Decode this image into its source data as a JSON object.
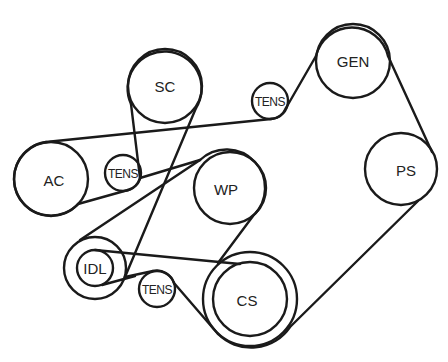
{
  "diagram": {
    "type": "serpentine-belt-routing",
    "colors": {
      "stroke": "#1a1a1a",
      "text": "#222222",
      "background": "#ffffff"
    },
    "pulleys": {
      "sc": {
        "label": "SC",
        "cx": 165,
        "cy": 86,
        "r": 37
      },
      "gen": {
        "label": "GEN",
        "cx": 353,
        "cy": 61,
        "r": 37
      },
      "tens_top": {
        "label": "TENS",
        "cx": 270,
        "cy": 101,
        "r": 18
      },
      "ac": {
        "label": "AC",
        "cx": 51,
        "cy": 179,
        "r": 37
      },
      "tens_mid": {
        "label": "TENS",
        "cx": 123,
        "cy": 173,
        "r": 18
      },
      "wp": {
        "label": "WP",
        "cx": 230,
        "cy": 188,
        "r": 36
      },
      "ps": {
        "label": "PS",
        "cx": 401,
        "cy": 169,
        "r": 36
      },
      "idl": {
        "label": "IDL",
        "cx": 95,
        "cy": 268,
        "r_outer": 31,
        "r_inner": 18
      },
      "tens_low": {
        "label": "TENS",
        "cx": 157,
        "cy": 289,
        "r": 18
      },
      "cs": {
        "label": "CS",
        "cx": 250,
        "cy": 299,
        "r_outer": 47,
        "r_inner": 37
      }
    },
    "belts": [
      {
        "name": "outer-belt",
        "route": [
          "CS",
          "PS",
          "GEN",
          "TENS",
          "AC",
          "TENS",
          "SC",
          "IDL",
          "TENS",
          "CS"
        ]
      },
      {
        "name": "inner-belt",
        "route": [
          "CS",
          "WP",
          "IDL",
          "CS"
        ]
      }
    ]
  }
}
